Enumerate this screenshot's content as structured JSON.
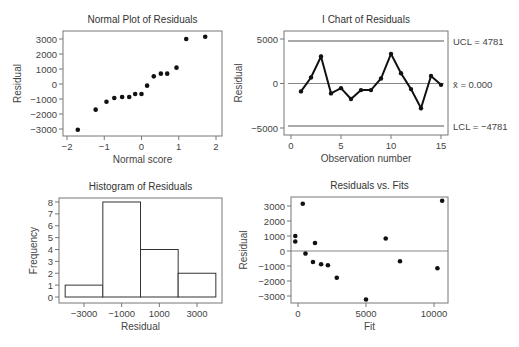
{
  "figure": {
    "panels": [
      "normal_plot",
      "i_chart",
      "histogram",
      "residuals_vs_fits"
    ]
  },
  "chart_data": [
    {
      "id": "normal_plot",
      "type": "scatter",
      "title": "Normal Plot of Residuals",
      "xlabel": "Normal score",
      "ylabel": "Residual",
      "xlim": [
        -2.1,
        2.1
      ],
      "ylim": [
        -3500,
        3600
      ],
      "xticks": [
        -2,
        -1,
        0,
        1,
        2
      ],
      "xtick_labels": [
        "-2",
        "-1",
        "0",
        "1",
        "2"
      ],
      "yticks": [
        3000,
        2000,
        1000,
        0,
        -1000,
        -2000,
        -3000
      ],
      "ytick_labels": [
        "3000",
        "2000",
        "1000",
        "0",
        "-1000",
        "-2000",
        "-3000"
      ],
      "grid": false,
      "points": [
        {
          "x": -1.71,
          "y": -3050
        },
        {
          "x": -1.23,
          "y": -1710
        },
        {
          "x": -0.94,
          "y": -1180
        },
        {
          "x": -0.73,
          "y": -930
        },
        {
          "x": -0.52,
          "y": -870
        },
        {
          "x": -0.33,
          "y": -870
        },
        {
          "x": -0.17,
          "y": -670
        },
        {
          "x": 0.0,
          "y": -670
        },
        {
          "x": 0.15,
          "y": -110
        },
        {
          "x": 0.33,
          "y": 510
        },
        {
          "x": 0.52,
          "y": 690
        },
        {
          "x": 0.69,
          "y": 690
        },
        {
          "x": 0.94,
          "y": 1090
        },
        {
          "x": 1.2,
          "y": 3000
        },
        {
          "x": 1.71,
          "y": 3150
        }
      ]
    },
    {
      "id": "i_chart",
      "type": "line",
      "title": "I Chart of Residuals",
      "xlabel": "Observation number",
      "ylabel": "Residual",
      "xlim": [
        -0.5,
        15.7
      ],
      "ylim": [
        -5800,
        5800
      ],
      "xticks": [
        0,
        5,
        10,
        15
      ],
      "xtick_labels": [
        "0",
        "5",
        "10",
        "15"
      ],
      "yticks": [
        5000,
        0,
        -5000
      ],
      "ytick_labels": [
        "5000",
        "0",
        "-5000"
      ],
      "grid": false,
      "x": [
        1,
        2,
        3,
        4,
        5,
        6,
        7,
        8,
        9,
        10,
        11,
        12,
        13,
        14,
        15
      ],
      "values": [
        -890,
        670,
        3030,
        -1110,
        -520,
        -1740,
        -740,
        -740,
        560,
        3330,
        1150,
        -630,
        -2780,
        850,
        -150
      ],
      "control_lines": [
        {
          "name": "UCL",
          "value": 4781,
          "label": "UCL = 4781"
        },
        {
          "name": "center",
          "value": 0,
          "label": "x̄ = 0.000"
        },
        {
          "name": "LCL",
          "value": -4781,
          "label": "LCL = -4781"
        }
      ]
    },
    {
      "id": "histogram",
      "type": "bar",
      "title": "Histogram of Residuals",
      "xlabel": "Residual",
      "ylabel": "Frequency",
      "bin_edges": [
        -4000,
        -2000,
        0,
        2000,
        4000
      ],
      "categories": [
        "-4000 to -2000",
        "-2000 to 0",
        "0 to 2000",
        "2000 to 4000"
      ],
      "values": [
        1,
        8,
        4,
        2
      ],
      "xlim": [
        -4400,
        4400
      ],
      "ylim": [
        -0.3,
        8.2
      ],
      "xticks": [
        -3000,
        -1000,
        1000,
        3000
      ],
      "xtick_labels": [
        "-3000",
        "-1000",
        "1000",
        "3000"
      ],
      "yticks": [
        0,
        1,
        2,
        3,
        4,
        5,
        6,
        7,
        8
      ],
      "ytick_labels": [
        "0",
        "1",
        "2",
        "3",
        "4",
        "5",
        "6",
        "7",
        "8"
      ],
      "grid": false
    },
    {
      "id": "residuals_vs_fits",
      "type": "scatter",
      "title": "Residuals vs. Fits",
      "xlabel": "Fit",
      "ylabel": "Residual",
      "xlim": [
        -500,
        10800
      ],
      "ylim": [
        -3500,
        3600
      ],
      "xticks": [
        0,
        5000,
        10000
      ],
      "xtick_labels": [
        "0",
        "5000",
        "10000"
      ],
      "yticks": [
        3000,
        2000,
        1000,
        0,
        -1000,
        -2000,
        -3000
      ],
      "ytick_labels": [
        "3000",
        "2000",
        "1000",
        "0",
        "-1000",
        "-2000",
        "-3000"
      ],
      "reference_line": 0,
      "grid": false,
      "points": [
        {
          "x": -200,
          "y": 1000
        },
        {
          "x": -200,
          "y": 630
        },
        {
          "x": 350,
          "y": 3150
        },
        {
          "x": 550,
          "y": -170
        },
        {
          "x": 1100,
          "y": -730
        },
        {
          "x": 1250,
          "y": 530
        },
        {
          "x": 1700,
          "y": -880
        },
        {
          "x": 2200,
          "y": -950
        },
        {
          "x": 2850,
          "y": -1780
        },
        {
          "x": 5000,
          "y": -3230
        },
        {
          "x": 6450,
          "y": 830
        },
        {
          "x": 7500,
          "y": -680
        },
        {
          "x": 10250,
          "y": -1150
        },
        {
          "x": 10600,
          "y": 3350
        }
      ]
    }
  ]
}
